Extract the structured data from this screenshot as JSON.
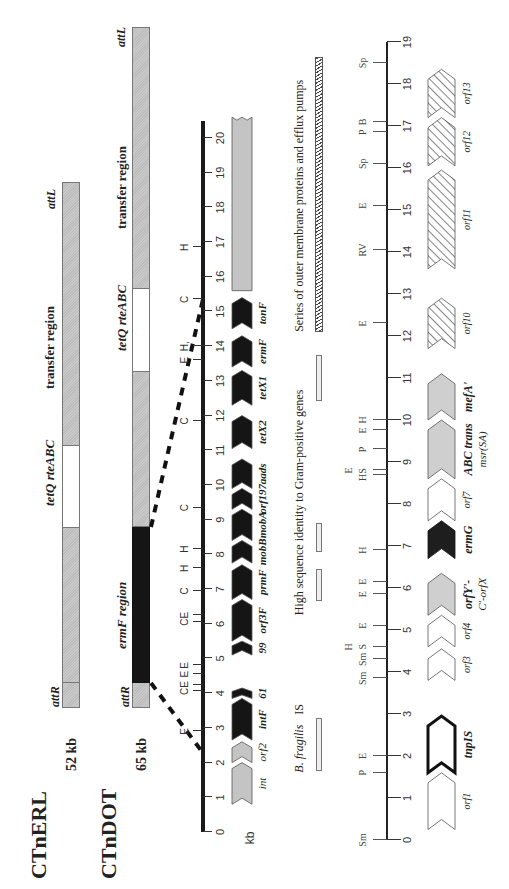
{
  "elements": {
    "ctnerl": {
      "name": "CTnERL",
      "size": "52 kb",
      "att_right": "attR",
      "att_left": "attL",
      "regions": [
        {
          "label": "tetQ rteABC",
          "style": "white"
        },
        {
          "label": "transfer region",
          "style": "grey"
        }
      ]
    },
    "ctndot": {
      "name": "CTnDOT",
      "size": "65 kb",
      "att_right": "attR",
      "att_left": "attL",
      "regions": [
        {
          "label": "ermF region",
          "style": "black"
        },
        {
          "label": "tetQ rteABC",
          "style": "white"
        },
        {
          "label": "transfer region",
          "style": "grey"
        }
      ]
    }
  },
  "ermf_map": {
    "unit": "kb",
    "scale_ticks": [
      0,
      1,
      2,
      3,
      4,
      5,
      6,
      7,
      8,
      9,
      10,
      11,
      12,
      13,
      14,
      15,
      16,
      17,
      18,
      19,
      20
    ],
    "restriction_sites": [
      {
        "label": "E",
        "kb": 2.9
      },
      {
        "label": "C",
        "kb": 4.05
      },
      {
        "label": "E",
        "kb": 4.25
      },
      {
        "label": "E",
        "kb": 4.55
      },
      {
        "label": "E",
        "kb": 4.8
      },
      {
        "label": "C",
        "kb": 6.05
      },
      {
        "label": "E",
        "kb": 6.25
      },
      {
        "label": "C",
        "kb": 6.95
      },
      {
        "label": "H",
        "kb": 7.6
      },
      {
        "label": "H",
        "kb": 8.15
      },
      {
        "label": "C",
        "kb": 9.35
      },
      {
        "label": "C",
        "kb": 11.85
      },
      {
        "label": "E",
        "kb": 13.6
      },
      {
        "label": "H,",
        "kb": 14.0
      },
      {
        "label": "C",
        "kb": 15.35
      },
      {
        "label": "H",
        "kb": 16.85
      }
    ],
    "genes": [
      {
        "label": "int",
        "start": 0.8,
        "end": 2.0,
        "style": "grey",
        "bold": false
      },
      {
        "label": "orf2",
        "start": 2.0,
        "end": 2.6,
        "style": "grey",
        "bold": false
      },
      {
        "label": "intF",
        "start": 2.65,
        "end": 3.85,
        "style": "black",
        "bold": true
      },
      {
        "label": "61",
        "start": 3.85,
        "end": 4.15,
        "style": "black",
        "bold": true
      },
      {
        "label": "99",
        "start": 5.1,
        "end": 5.5,
        "style": "black",
        "bold": true
      },
      {
        "label": "orf3F",
        "start": 5.5,
        "end": 6.7,
        "style": "black",
        "bold": true
      },
      {
        "label": "prmF",
        "start": 6.7,
        "end": 7.7,
        "style": "black",
        "bold": true
      },
      {
        "label": "mobB",
        "start": 7.75,
        "end": 8.4,
        "style": "black",
        "bold": true
      },
      {
        "label": "mobA",
        "start": 8.4,
        "end": 9.3,
        "style": "black",
        "bold": true
      },
      {
        "label": "orf197",
        "start": 9.3,
        "end": 9.9,
        "style": "black",
        "bold": true
      },
      {
        "label": "aads",
        "start": 9.9,
        "end": 10.75,
        "style": "black",
        "bold": true
      },
      {
        "label": "tetX2",
        "start": 11.05,
        "end": 12.0,
        "style": "black",
        "bold": true
      },
      {
        "label": "tetX1",
        "start": 12.3,
        "end": 13.3,
        "style": "black",
        "bold": true
      },
      {
        "label": "ermF",
        "start": 13.4,
        "end": 14.3,
        "style": "black",
        "bold": true
      },
      {
        "label": "tonF",
        "start": 14.5,
        "end": 15.4,
        "style": "black",
        "bold": true
      },
      {
        "label": "",
        "start": 15.6,
        "end": 20.6,
        "style": "grey",
        "bold": false
      }
    ]
  },
  "lower_map": {
    "scale_ticks": [
      0,
      1,
      2,
      3,
      4,
      5,
      6,
      7,
      8,
      9,
      10,
      11,
      12,
      13,
      14,
      15,
      16,
      17,
      18,
      19
    ],
    "annotations": [
      {
        "label": "B. fragilis",
        "italic": true,
        "label2": "IS",
        "start": 1.65,
        "end": 2.85
      },
      {
        "label": "High sequence identity to Gram-positive genes",
        "bars": [
          [
            5.7,
            6.4
          ],
          [
            6.85,
            7.5
          ],
          [
            10.45,
            11.5
          ]
        ]
      },
      {
        "label": "Series of outer membrane proteins and efflux pumps",
        "start": 12.1,
        "end": 18.6,
        "hatched": true
      }
    ],
    "restriction_sites": [
      {
        "label": "Sm",
        "kb": 0.0
      },
      {
        "label": "P",
        "kb": 1.6
      },
      {
        "label": "E",
        "kb": 2.0
      },
      {
        "label": "Sm",
        "kb": 3.85
      },
      {
        "label": "Sm",
        "kb": 4.3
      },
      {
        "label": "S",
        "kb": 4.6
      },
      {
        "label": "H",
        "kb": 4.6,
        "offset": true
      },
      {
        "label": "E",
        "kb": 5.1
      },
      {
        "label": "E",
        "kb": 5.85
      },
      {
        "label": "E",
        "kb": 6.15
      },
      {
        "label": "H",
        "kb": 6.9
      },
      {
        "label": "HS",
        "kb": 8.7
      },
      {
        "label": "E",
        "kb": 8.8,
        "offset": true
      },
      {
        "label": "P",
        "kb": 9.3
      },
      {
        "label": "E",
        "kb": 9.75
      },
      {
        "label": "H",
        "kb": 10.0
      },
      {
        "label": "E",
        "kb": 12.3
      },
      {
        "label": "RV",
        "kb": 14.05
      },
      {
        "label": "E",
        "kb": 15.1
      },
      {
        "label": "Sp",
        "kb": 16.1
      },
      {
        "label": "P",
        "kb": 16.85
      },
      {
        "label": "B",
        "kb": 17.1
      },
      {
        "label": "Sp",
        "kb": 18.5
      }
    ],
    "genes": [
      {
        "label": "orf1",
        "start": 0.25,
        "end": 1.6,
        "style": "white",
        "bold": false
      },
      {
        "label": "tnpIS",
        "start": 1.6,
        "end": 2.95,
        "style": "thick",
        "bold": true
      },
      {
        "label": "orf3",
        "start": 3.8,
        "end": 4.55,
        "style": "white",
        "bold": false
      },
      {
        "label": "orf4",
        "start": 4.6,
        "end": 5.35,
        "style": "white",
        "bold": false
      },
      {
        "label": "orfY'-",
        "label2": "C'-orfX",
        "start": 5.35,
        "end": 6.35,
        "style": "grey",
        "bold": true
      },
      {
        "label": "ermG",
        "start": 6.7,
        "end": 7.6,
        "style": "black",
        "bold": true
      },
      {
        "label": "orf7",
        "start": 7.6,
        "end": 8.6,
        "style": "white",
        "bold": false
      },
      {
        "label": "ABC trans",
        "label2": "msr(SA)",
        "start": 8.6,
        "end": 10.0,
        "style": "grey",
        "bold": true
      },
      {
        "label": "mefA'",
        "start": 10.0,
        "end": 11.1,
        "style": "grey",
        "bold": true
      },
      {
        "label": "orf10",
        "start": 11.7,
        "end": 12.9,
        "style": "hatched",
        "bold": false
      },
      {
        "label": "orf11",
        "start": 13.6,
        "end": 15.95,
        "style": "hatched",
        "bold": false
      },
      {
        "label": "orf12",
        "start": 16.05,
        "end": 17.2,
        "style": "hatched",
        "bold": false
      },
      {
        "label": "orf13",
        "start": 17.2,
        "end": 18.35,
        "style": "hatched",
        "bold": false
      }
    ]
  }
}
